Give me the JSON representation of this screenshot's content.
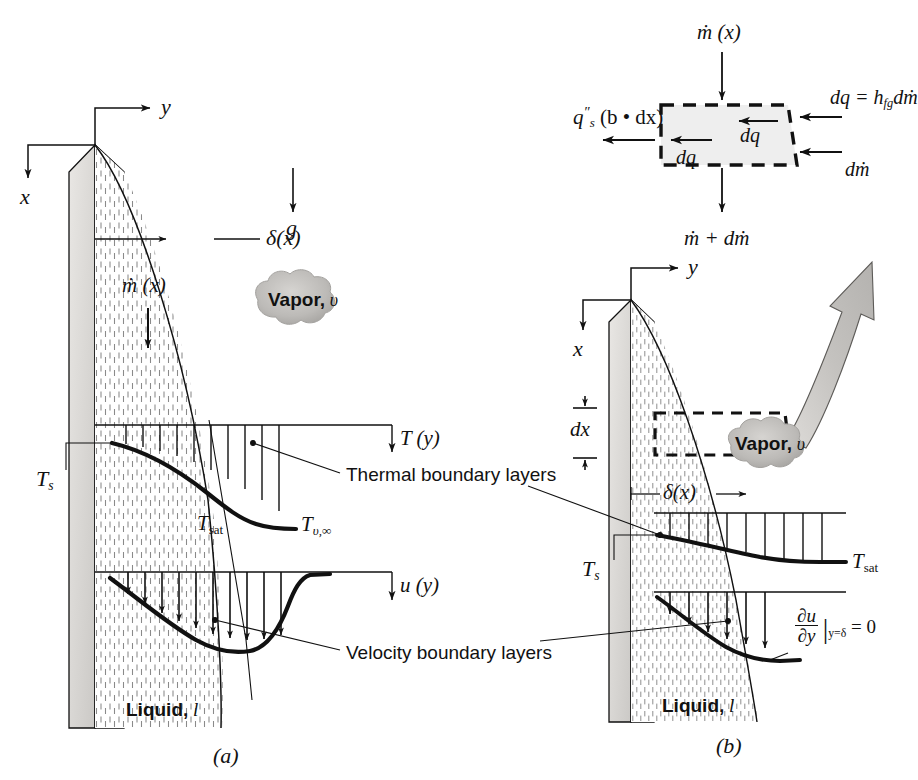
{
  "figure": {
    "type": "engineering-diagram",
    "topic": "Film condensation boundary layers on a vertical plate",
    "panel_a_caption": "(a)",
    "panel_b_caption": "(b)"
  },
  "panel_a": {
    "axis_x": "x",
    "axis_y": "y",
    "gravity_label": "g",
    "delta_label": "δ(x)",
    "mdot_label": "ṁ (x)",
    "vapor_label": "Vapor,",
    "vapor_symbol": "υ",
    "liquid_label": "Liquid,",
    "liquid_symbol": "l",
    "wall_temp": "T",
    "wall_temp_sub": "s",
    "t_profile_label": "T (y)",
    "u_profile_label": "u (y)",
    "t_sat": "T",
    "t_sat_sub": "sat",
    "t_vinf": "T",
    "t_vinf_sub": "υ,∞",
    "thermal_callout": "Thermal boundary layers",
    "velocity_callout": "Velocity boundary layers"
  },
  "panel_b": {
    "axis_x": "x",
    "axis_y": "y",
    "dx_label": "dx",
    "delta_label": "δ(x)",
    "vapor_label": "Vapor,",
    "vapor_symbol": "υ",
    "liquid_label": "Liquid,",
    "liquid_symbol": "l",
    "wall_temp": "T",
    "wall_temp_sub": "s",
    "t_sat": "T",
    "t_sat_sub": "sat",
    "shear_num": "∂u",
    "shear_den": "∂y",
    "shear_at": "y=δ",
    "shear_eq": "= 0"
  },
  "control_volume": {
    "inflow_top": "ṁ (x)",
    "outflow_bottom": "ṁ + dṁ",
    "surface_flux": "q",
    "surface_flux_sup": "″",
    "surface_flux_sub": "s",
    "surface_flux_tail": "(b • dx)",
    "dq_left": "dq",
    "dq_inner": "dq",
    "latent_lhs": "dq = h",
    "latent_sub": "fg",
    "latent_rhs": "dṁ",
    "dmdot": "dṁ"
  },
  "colors": {
    "ink": "#111111",
    "wall_fill": "#d8d8d8",
    "wall_light": "#ebe9e6",
    "cv_fill": "#eeeeee",
    "vapor_arrow": "#c9c9c9",
    "cloud": "#b9b7b4",
    "hatch": "#8a8a8a"
  }
}
